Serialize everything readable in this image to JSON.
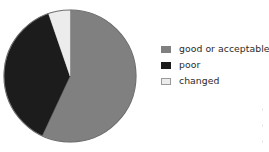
{
  "chart_data": {
    "type": "pie",
    "title": "",
    "subtitle": "",
    "xlabel": "",
    "ylabel": "",
    "grid": false,
    "legend_position": "right",
    "categories": [
      "good or acceptable",
      "poor",
      "changed"
    ],
    "values": [
      57,
      38,
      5
    ],
    "units": "percent",
    "start_angle_deg": 0,
    "direction": "clockwise",
    "slices": [
      {
        "label": "good or acceptable",
        "value": 57,
        "color": "#808080",
        "start_angle_deg": 0,
        "end_angle_deg": 205
      },
      {
        "label": "poor",
        "value": 38,
        "color": "#1c1c1c",
        "start_angle_deg": 205,
        "end_angle_deg": 341
      },
      {
        "label": "changed",
        "value": 5,
        "color": "#ececec",
        "start_angle_deg": 341,
        "end_angle_deg": 360
      }
    ]
  },
  "legend": {
    "items": [
      {
        "label": "good or acceptable",
        "swatch_name": "legend-swatch-good-or-acceptable"
      },
      {
        "label": "poor",
        "swatch_name": "legend-swatch-poor"
      },
      {
        "label": "changed",
        "swatch_name": "legend-swatch-changed"
      }
    ]
  },
  "colors": {
    "good_or_acceptable": "#808080",
    "poor": "#1c1c1c",
    "changed": "#ececec",
    "outline": "#6f6f6f",
    "background": "#ffffff",
    "text": "#2a2a2a"
  },
  "geometry": {
    "center_x": 68,
    "center_y": 68,
    "radius": 66
  }
}
